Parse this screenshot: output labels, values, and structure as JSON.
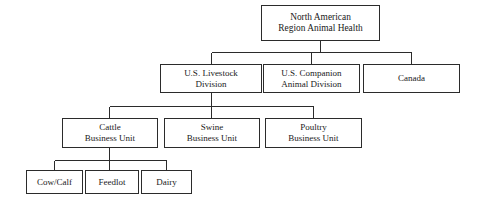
{
  "diagram": {
    "type": "organizational-chart",
    "orientation": "top-down",
    "background_color": "#ffffff",
    "line_color": "#2b2b2b",
    "text_color": "#1a1a1a",
    "levels": 4,
    "nodes": {
      "root": {
        "label": "North American\nRegion Animal Health",
        "level": 1
      },
      "livestock": {
        "label": "U.S. Livestock\nDivision",
        "level": 2
      },
      "companion": {
        "label": "U.S. Companion\nAnimal Division",
        "level": 2
      },
      "canada": {
        "label": "Canada",
        "level": 2
      },
      "cattle": {
        "label": "Cattle\nBusiness Unit",
        "level": 3
      },
      "swine": {
        "label": "Swine\nBusiness Unit",
        "level": 3
      },
      "poultry": {
        "label": "Poultry\nBusiness Unit",
        "level": 3
      },
      "cowcalf": {
        "label": "Cow/Calf",
        "level": 4
      },
      "feedlot": {
        "label": "Feedlot",
        "level": 4
      },
      "dairy": {
        "label": "Dairy",
        "level": 4
      }
    },
    "edges": [
      {
        "from": "root",
        "to": "livestock"
      },
      {
        "from": "root",
        "to": "companion"
      },
      {
        "from": "root",
        "to": "canada"
      },
      {
        "from": "livestock",
        "to": "cattle"
      },
      {
        "from": "livestock",
        "to": "swine"
      },
      {
        "from": "livestock",
        "to": "poultry"
      },
      {
        "from": "cattle",
        "to": "cowcalf"
      },
      {
        "from": "cattle",
        "to": "feedlot"
      },
      {
        "from": "cattle",
        "to": "dairy"
      }
    ]
  }
}
